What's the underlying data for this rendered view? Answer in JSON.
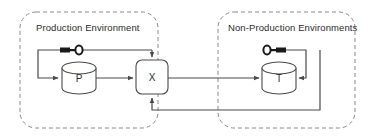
{
  "diagram": {
    "canvas": {
      "width": 381,
      "height": 139,
      "background": "#ffffff"
    },
    "colors": {
      "stroke": "#4a4a4a",
      "zone_border": "#8a8a8a",
      "text": "#2b2b2b",
      "key_fill": "#1a1a1a",
      "node_fill": "#ffffff"
    },
    "zones": [
      {
        "id": "production",
        "label": "Production Environment",
        "style": "dashed-rounded-rect",
        "x": 20,
        "y": 12,
        "width": 138,
        "height": 116
      },
      {
        "id": "non-production",
        "label": "Non-Production Environments",
        "style": "dashed-rounded-rect",
        "x": 218,
        "y": 12,
        "width": 137,
        "height": 116
      }
    ],
    "nodes": [
      {
        "id": "p-database",
        "label": "P",
        "shape": "cylinder",
        "zone": "production",
        "x": 62,
        "y": 62,
        "width": 34,
        "height": 32
      },
      {
        "id": "x-process",
        "label": "X",
        "shape": "rounded-rect",
        "zone": "production",
        "x": 136,
        "y": 60,
        "width": 32,
        "height": 34
      },
      {
        "id": "t-database",
        "label": "T",
        "shape": "cylinder",
        "zone": "non-production",
        "x": 262,
        "y": 62,
        "width": 34,
        "height": 32
      }
    ],
    "icons": [
      {
        "id": "key-production",
        "name": "key-icon",
        "orientation": "teeth-left",
        "zone": "production",
        "x": 60,
        "y": 46
      },
      {
        "id": "key-non-production",
        "name": "key-icon",
        "orientation": "teeth-right",
        "zone": "non-production",
        "x": 264,
        "y": 46
      }
    ],
    "edges": [
      {
        "id": "feedback-to-p",
        "from": "x-process",
        "to": "p-database",
        "path": "top-loop-left",
        "arrow": true
      },
      {
        "id": "p-to-x",
        "from": "p-database",
        "to": "x-process",
        "path": "horizontal",
        "arrow": true
      },
      {
        "id": "key-to-x",
        "from": "key-production",
        "to": "x-process",
        "path": "top-into-x",
        "arrow": true
      },
      {
        "id": "x-to-t",
        "from": "x-process",
        "to": "t-database",
        "path": "horizontal-cross-zone",
        "arrow": true
      },
      {
        "id": "t-loop",
        "from": "key-non-production",
        "to": "t-database",
        "path": "right-loop-into-t",
        "arrow": true
      },
      {
        "id": "t-return-to-x",
        "from": "t-database",
        "to": "x-process",
        "path": "bottom-return",
        "arrow": true
      }
    ]
  }
}
